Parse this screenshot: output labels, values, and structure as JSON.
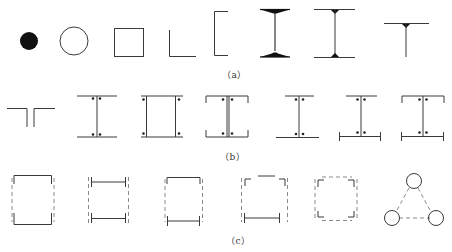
{
  "figure": {
    "background": "#ffffff",
    "line_color": "#3a3a3a",
    "dashed_color": "#8a8a8a",
    "rows": [
      {
        "id": "a",
        "caption": "（a）",
        "shapes": [
          {
            "name": "solid-round-bar",
            "label": "filled circle"
          },
          {
            "name": "hollow-round-tube",
            "label": "hollow circle"
          },
          {
            "name": "square-tube",
            "label": "square box"
          },
          {
            "name": "angle-section",
            "label": "L angle"
          },
          {
            "name": "channel-section",
            "label": "C channel"
          },
          {
            "name": "tapered-i-beam",
            "label": "I-beam with tapered flanges"
          },
          {
            "name": "welded-i-beam",
            "label": "I-beam with fillet welds"
          },
          {
            "name": "t-section",
            "label": "T section"
          }
        ]
      },
      {
        "id": "b",
        "caption": "（b）",
        "shapes": [
          {
            "name": "double-angle-t",
            "label": "back-to-back angles"
          },
          {
            "name": "i-beam-with-bolts",
            "label": "I-section with 4 bolts at web"
          },
          {
            "name": "double-channel-box",
            "label": "boxed channels with corner bolts"
          },
          {
            "name": "double-channel-split",
            "label": "channels back-to-back with gap"
          },
          {
            "name": "i-with-unequal-flange",
            "label": "I-section with plate flange"
          },
          {
            "name": "i-with-bottom-plate",
            "label": "I-section with stiffened bottom plate"
          },
          {
            "name": "i-with-channel-cap",
            "label": "I-section with channel cap and plate"
          }
        ]
      },
      {
        "id": "c",
        "caption": "（c）",
        "shapes": [
          {
            "name": "laced-channel-column",
            "label": "two channels with dashed lacing"
          },
          {
            "name": "laced-i-column",
            "label": "two I-flanges with dashed lacing"
          },
          {
            "name": "laced-channel-plate-column",
            "label": "channel and plate with dashed lacing"
          },
          {
            "name": "laced-angle-plate-column",
            "label": "angles with plate and dashed lacing"
          },
          {
            "name": "four-angle-laced-column",
            "label": "four angles with dashed lacing"
          },
          {
            "name": "three-tube-triangular-column",
            "label": "three tubes in triangle with dashed lacing"
          }
        ]
      }
    ]
  }
}
